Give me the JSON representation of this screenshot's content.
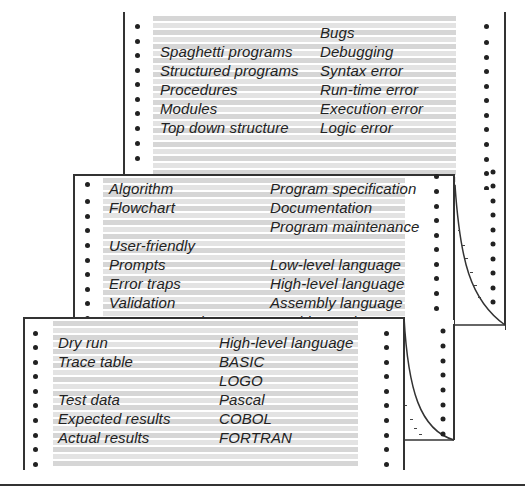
{
  "sheets": {
    "back": {
      "rows": [
        {
          "left": "",
          "right": "Bugs"
        },
        {
          "left": "Spaghetti programs",
          "right": "Debugging"
        },
        {
          "left": "Structured programs",
          "right": "Syntax error"
        },
        {
          "left": "Procedures",
          "right": "Run-time error"
        },
        {
          "left": "Modules",
          "right": "Execution error"
        },
        {
          "left": "Top down structure",
          "right": "Logic error"
        }
      ]
    },
    "middle": {
      "rows": [
        {
          "left": "Algorithm",
          "right": "Program specification"
        },
        {
          "left": "Flowchart",
          "right": "Documentation"
        },
        {
          "left": "",
          "right": "Program maintenance"
        },
        {
          "left": "User-friendly",
          "right": ""
        },
        {
          "left": "Prompts",
          "right": "Low-level language"
        },
        {
          "left": "Error traps",
          "right": "High-level language"
        },
        {
          "left": "Validation",
          "right": "Assembly language"
        },
        {
          "left": "Program crash",
          "right": "Machine code"
        }
      ]
    },
    "front": {
      "rows": [
        {
          "left": "Dry run",
          "right": "High-level language"
        },
        {
          "left": "Trace table",
          "right": "BASIC"
        },
        {
          "left": "",
          "right": "LOGO"
        },
        {
          "left": "Test data",
          "right": "Pascal"
        },
        {
          "left": "Expected results",
          "right": "COBOL"
        },
        {
          "left": "Actual results",
          "right": "FORTRAN"
        }
      ]
    }
  },
  "colors": {
    "ink": "#222222",
    "stripe": "#d6d6d6",
    "border": "#333333"
  }
}
